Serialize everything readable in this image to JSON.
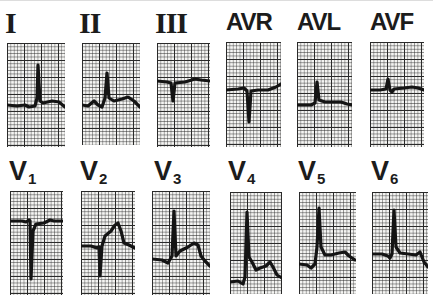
{
  "figure": {
    "limb_leads": [
      {
        "label": "I",
        "trace": "M0,62 L10,63 L18,62 L22,64 L28,63 L30,55 L31,22 L33,58 L36,60 L45,58 L52,59 L58,64"
      },
      {
        "label": "II",
        "trace": "M0,62 L6,63 L12,58 L16,62 L20,64 L23,55 L25,30 L27,55 L32,58 L40,56 L46,54 L52,58 L58,64"
      },
      {
        "label": "III",
        "trace": "M0,38 L10,39 L14,40 L16,58 L18,40 L28,39 L38,36 L44,37 L53,38"
      },
      {
        "label": "AVR",
        "trace": "M0,48 L12,47 L18,46 L21,49 L23,80 L25,49 L32,48 L42,48 L50,45 L55,42"
      },
      {
        "label": "AVL",
        "trace": "M0,63 L14,63 L18,61 L20,40 L22,58 L28,60 L38,60 L44,60 L50,62 L55,63"
      },
      {
        "label": "AVF",
        "trace": "M0,48 L10,48 L16,47 L18,37 L20,48 L22,50 L24,47 L34,46 L42,45 L48,46 L54,48"
      }
    ],
    "chest_leads": [
      {
        "label": "V",
        "sub": "1",
        "trace": "M0,30 L12,30 L16,31 L19,29 L20,30 L21,88 L23,40 L26,33 L34,32 L40,29 L44,30 L53,30"
      },
      {
        "label": "V",
        "sub": "2",
        "trace": "M0,55 L10,55 L16,57 L18,56 L19,85 L21,55 L24,45 L30,40 L34,34 L37,32 L40,40 L43,52 L48,54 L54,57"
      },
      {
        "label": "V",
        "sub": "3",
        "trace": "M0,68 L10,69 L16,72 L20,65 L22,20 L24,65 L28,60 L36,56 L42,52 L46,54 L49,65 L53,70 L58,75"
      },
      {
        "label": "V",
        "sub": "4",
        "trace": "M0,90 L8,89 L13,92 L15,85 L17,20 L19,65 L22,70 L26,78 L30,76 L36,74 L40,70 L43,75 L47,83 L52,86"
      },
      {
        "label": "V",
        "sub": "5",
        "trace": "M0,72 L8,73 L12,76 L16,72 L18,55 L20,16 L22,55 L26,63 L32,63 L40,61 L46,60 L50,64 L56,68"
      },
      {
        "label": "V",
        "sub": "6",
        "trace": "M0,62 L10,62 L16,64 L18,66 L20,62 L22,18 L24,55 L28,61 L36,62 L44,63 L48,60 L52,70 L56,75"
      }
    ]
  }
}
